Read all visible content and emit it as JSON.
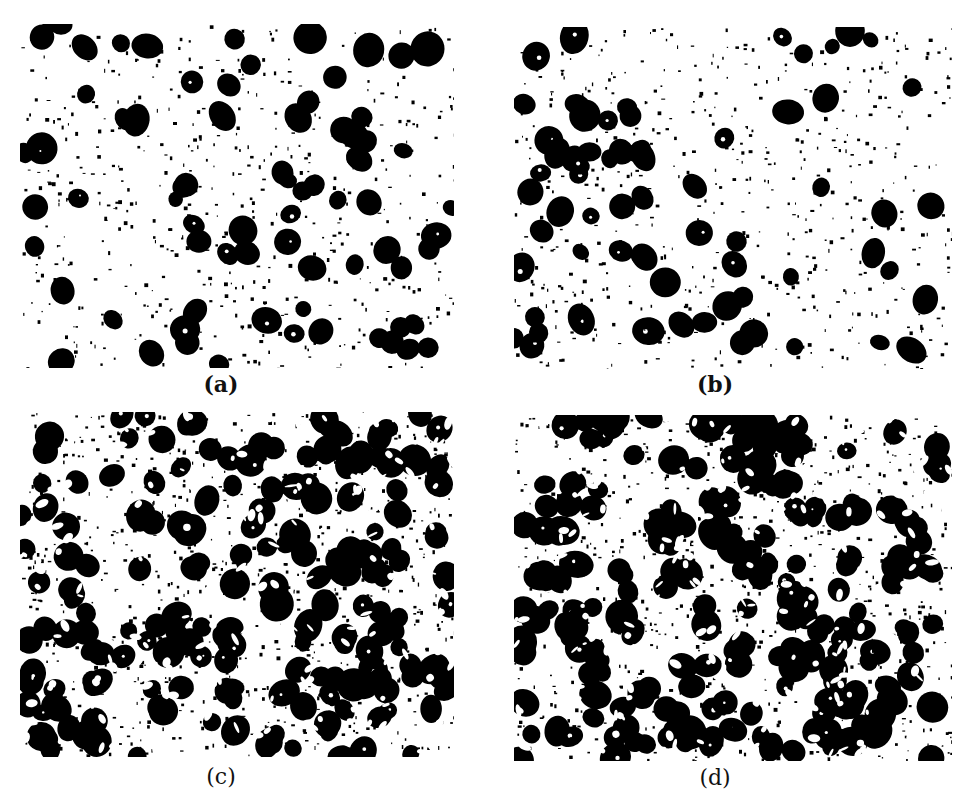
{
  "figure": {
    "top_cutoff_text": "",
    "panels": [
      {
        "id": "a",
        "label": "(a)",
        "x": 20,
        "y": 24,
        "w": 434,
        "h": 344,
        "density": 0.55,
        "seed": 11,
        "bold_label": true
      },
      {
        "id": "b",
        "label": "(b)",
        "x": 514,
        "y": 27,
        "w": 438,
        "h": 342,
        "density": 0.5,
        "seed": 23,
        "bold_label": true
      },
      {
        "id": "c",
        "label": "(c)",
        "x": 20,
        "y": 412,
        "w": 434,
        "h": 345,
        "density": 1.35,
        "seed": 37,
        "bold_label": false
      },
      {
        "id": "d",
        "label": "(d)",
        "x": 514,
        "y": 415,
        "w": 438,
        "h": 346,
        "density": 1.55,
        "seed": 51,
        "bold_label": false
      }
    ],
    "label_positions": [
      {
        "id": "a",
        "x": 207,
        "y": 372
      },
      {
        "id": "b",
        "x": 701,
        "y": 372
      },
      {
        "id": "c",
        "x": 207,
        "y": 765
      },
      {
        "id": "d",
        "x": 701,
        "y": 766
      }
    ],
    "colors": {
      "foreground": "#000000",
      "background": "#ffffff"
    }
  }
}
